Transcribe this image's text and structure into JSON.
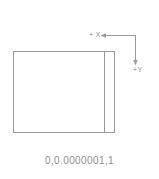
{
  "drawing": {
    "background_color": "#ffffff",
    "line_color": "#9a9a9a",
    "text_color": "#8d8d8d",
    "shape": {
      "name": "rectangle-outline",
      "left": 13,
      "top": 51,
      "right": 115,
      "bottom": 133,
      "interior_vertical_line_x": 104
    }
  },
  "axes": {
    "x_label": "+ X",
    "y_label": "+Y",
    "corner_x": 135,
    "corner_y": 35,
    "x_arrow_tip_x": 101,
    "y_arrow_tip_y": 64
  },
  "caption": {
    "text": "0,0.0000001,1"
  }
}
